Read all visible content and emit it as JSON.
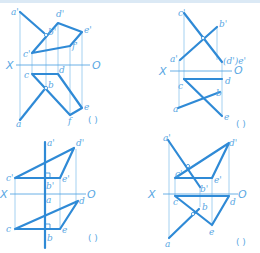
{
  "header": {
    "cropped_text": "…(cropped instruction text)…"
  },
  "colors": {
    "line": "#2f8ad6",
    "projector": "#8ec5ee",
    "label": "#5aa7e3"
  },
  "panels": [
    {
      "id": 1,
      "axis": {
        "x_label": "X",
        "o_label": "O"
      },
      "labels": {
        "a1": "a'",
        "d1": "d'",
        "e1": "e'",
        "b1": "b'",
        "f1": "f'",
        "c1": "c'",
        "c": "c",
        "d": "d",
        "b": "b",
        "e": "e",
        "f": "f",
        "a": "a"
      },
      "answer": "(   )"
    },
    {
      "id": 2,
      "axis": {
        "x_label": "X",
        "o_label": "O"
      },
      "labels": {
        "c1": "c'",
        "b1": "b'",
        "a1": "a'",
        "de1": "(d')e'",
        "c": "c",
        "d": "d",
        "b": "b",
        "a": "a",
        "e": "e"
      },
      "answer": "(   )"
    },
    {
      "id": 3,
      "axis": {
        "x_label": "X",
        "o_label": "O"
      },
      "labels": {
        "a1": "a'",
        "d1": "d'",
        "c1": "c'",
        "b1": "b'",
        "e1": "e'",
        "a": "a",
        "d": "d",
        "c": "c",
        "b": "b",
        "e": "e"
      },
      "answer": "(   )"
    },
    {
      "id": 4,
      "axis": {
        "x_label": "X",
        "o_label": "O"
      },
      "labels": {
        "a1": "a'",
        "d1": "d'",
        "c1": "c'",
        "e1": "e'",
        "b1": "b'",
        "c": "c",
        "d": "d",
        "b": "b",
        "e": "e",
        "a": "a"
      },
      "answer": "(   )"
    }
  ]
}
